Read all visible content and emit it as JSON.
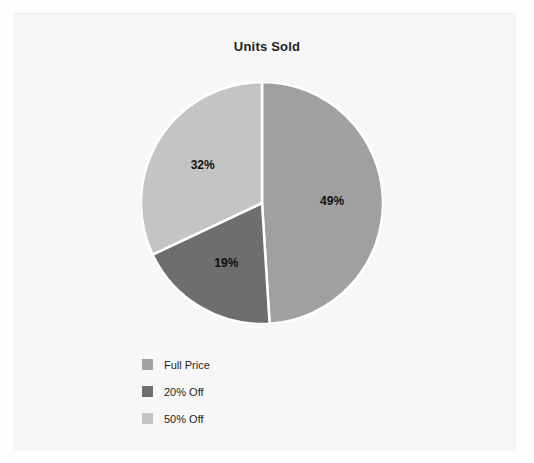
{
  "chart_data": {
    "type": "pie",
    "title": "Units Sold",
    "xlabel": "",
    "ylabel": "",
    "grid": false,
    "legend_position": "bottom-left",
    "start_angle_deg": 0,
    "direction": "clockwise",
    "categories": [
      "Full Price",
      "20% Off",
      "50% Off"
    ],
    "values": [
      49,
      19,
      32
    ],
    "value_unit": "%",
    "data_labels": [
      "49%",
      "19%",
      "32%"
    ],
    "slice_colors": [
      "#a0a0a0",
      "#6e6e6e",
      "#c4c4c4"
    ],
    "separator_color": "#ffffff",
    "slices": [
      {
        "label": "Full Price",
        "value": 49,
        "data_label": "49%",
        "color": "#a0a0a0"
      },
      {
        "label": "20% Off",
        "value": 19,
        "data_label": "19%",
        "color": "#6e6e6e"
      },
      {
        "label": "50% Off",
        "value": 32,
        "data_label": "32%",
        "color": "#c4c4c4"
      }
    ]
  },
  "legend": {
    "items": [
      {
        "label": "Full Price",
        "color": "#a0a0a0"
      },
      {
        "label": "20% Off",
        "color": "#6e6e6e"
      },
      {
        "label": "50% Off",
        "color": "#c4c4c4"
      }
    ]
  },
  "colors": {
    "background": "#fdfdfd",
    "plot_area": "#f7f7f7",
    "frame_border": "#f1f1f1",
    "title_text": "#1f1f1f",
    "label_text": "#101010"
  }
}
